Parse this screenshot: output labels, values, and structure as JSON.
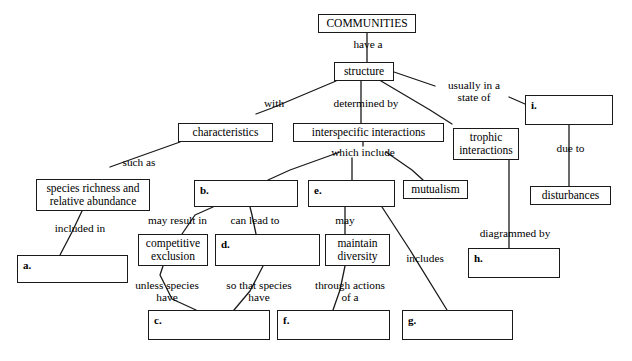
{
  "diagram": {
    "background_color": "#ffffff",
    "stroke_color": "#1a1a1a",
    "nodes": [
      {
        "id": "communities",
        "label": "COMMUNITIES",
        "x": 318,
        "y": 14,
        "w": 98,
        "h": 19,
        "blank": false
      },
      {
        "id": "structure",
        "label": "structure",
        "x": 334,
        "y": 62,
        "w": 60,
        "h": 19,
        "blank": false
      },
      {
        "id": "characteristics",
        "label": "characteristics",
        "x": 178,
        "y": 123,
        "w": 95,
        "h": 19,
        "blank": false
      },
      {
        "id": "interspecific",
        "label": "interspecific interactions",
        "x": 293,
        "y": 123,
        "w": 151,
        "h": 19,
        "blank": false
      },
      {
        "id": "trophic",
        "label": "trophic\ninteractions",
        "x": 453,
        "y": 128,
        "w": 66,
        "h": 32,
        "blank": false
      },
      {
        "id": "box_i",
        "label": "i.",
        "x": 525,
        "y": 95,
        "w": 88,
        "h": 30,
        "blank": true
      },
      {
        "id": "disturbances",
        "label": "disturbances",
        "x": 530,
        "y": 186,
        "w": 81,
        "h": 19,
        "blank": false
      },
      {
        "id": "species_richness",
        "label": "species richness and\nrelative abundance",
        "x": 36,
        "y": 179,
        "w": 114,
        "h": 32,
        "blank": false
      },
      {
        "id": "box_b",
        "label": "b.",
        "x": 194,
        "y": 180,
        "w": 104,
        "h": 27,
        "blank": true
      },
      {
        "id": "box_e",
        "label": "e.",
        "x": 308,
        "y": 180,
        "w": 87,
        "h": 27,
        "blank": true
      },
      {
        "id": "mutualism",
        "label": "mutualism",
        "x": 403,
        "y": 180,
        "w": 65,
        "h": 19,
        "blank": false
      },
      {
        "id": "box_a",
        "label": "a.",
        "x": 17,
        "y": 255,
        "w": 111,
        "h": 28,
        "blank": true
      },
      {
        "id": "competitive",
        "label": "competitive\nexclusion",
        "x": 138,
        "y": 234,
        "w": 70,
        "h": 32,
        "blank": false
      },
      {
        "id": "box_d",
        "label": "d.",
        "x": 215,
        "y": 234,
        "w": 105,
        "h": 32,
        "blank": true
      },
      {
        "id": "maintain",
        "label": "maintain\ndiversity",
        "x": 325,
        "y": 234,
        "w": 65,
        "h": 32,
        "blank": false
      },
      {
        "id": "box_h",
        "label": "h.",
        "x": 468,
        "y": 248,
        "w": 92,
        "h": 30,
        "blank": true
      },
      {
        "id": "box_c",
        "label": "c.",
        "x": 148,
        "y": 310,
        "w": 122,
        "h": 30,
        "blank": true
      },
      {
        "id": "box_f",
        "label": "f.",
        "x": 277,
        "y": 310,
        "w": 113,
        "h": 30,
        "blank": true
      },
      {
        "id": "box_g",
        "label": "g.",
        "x": 402,
        "y": 310,
        "w": 111,
        "h": 30,
        "blank": true
      }
    ],
    "link_labels": [
      {
        "id": "have_a",
        "text": "have a",
        "x": 342,
        "y": 38,
        "w": 52
      },
      {
        "id": "with",
        "text": "with",
        "x": 256,
        "y": 97,
        "w": 36
      },
      {
        "id": "determined_by",
        "text": "determined by",
        "x": 325,
        "y": 97,
        "w": 82
      },
      {
        "id": "usually_in_a",
        "text": "usually in a\nstate of",
        "x": 438,
        "y": 79,
        "w": 72
      },
      {
        "id": "such_as",
        "text": "such as",
        "x": 116,
        "y": 156,
        "w": 46
      },
      {
        "id": "which_include",
        "text": "which include",
        "x": 322,
        "y": 146,
        "w": 82
      },
      {
        "id": "due_to",
        "text": "due to",
        "x": 548,
        "y": 142,
        "w": 45
      },
      {
        "id": "included_in",
        "text": "included in",
        "x": 47,
        "y": 222,
        "w": 66
      },
      {
        "id": "may_result_in",
        "text": "may result in",
        "x": 139,
        "y": 214,
        "w": 77
      },
      {
        "id": "can_lead_to",
        "text": "can lead to",
        "x": 222,
        "y": 214,
        "w": 66
      },
      {
        "id": "may",
        "text": "may",
        "x": 330,
        "y": 214,
        "w": 30
      },
      {
        "id": "includes",
        "text": "includes",
        "x": 399,
        "y": 252,
        "w": 52
      },
      {
        "id": "diagrammed_by",
        "text": "diagrammed by",
        "x": 470,
        "y": 227,
        "w": 90
      },
      {
        "id": "unless_species_have",
        "text": "unless species\nhave",
        "x": 125,
        "y": 279,
        "w": 84
      },
      {
        "id": "so_that_species_have",
        "text": "so that species\nhave",
        "x": 215,
        "y": 279,
        "w": 88
      },
      {
        "id": "through_actions_of_a",
        "text": "through actions\nof a",
        "x": 304,
        "y": 279,
        "w": 92
      }
    ],
    "edges": [
      {
        "id": "communities-structure",
        "from": "communities",
        "to": "structure",
        "points": [
          [
            367,
            33
          ],
          [
            367,
            38
          ],
          [
            367,
            52
          ],
          [
            367,
            62
          ]
        ]
      },
      {
        "id": "structure-characteristics",
        "from": "structure",
        "to": "characteristics",
        "points": [
          [
            336,
            81
          ],
          [
            272,
            108
          ],
          [
            256,
            114
          ]
        ]
      },
      {
        "id": "structure-interspecific",
        "from": "structure",
        "to": "interspecific",
        "points": [
          [
            361,
            81
          ],
          [
            361,
            97
          ],
          [
            361,
            123
          ]
        ]
      },
      {
        "id": "structure-trophic",
        "from": "structure",
        "to": "trophic",
        "points": [
          [
            381,
            81
          ],
          [
            430,
            110
          ],
          [
            452,
            124
          ]
        ]
      },
      {
        "id": "structure-usually",
        "from": "structure",
        "to": "usually_in_a",
        "points": [
          [
            394,
            72
          ],
          [
            435,
            86
          ]
        ]
      },
      {
        "id": "usually-box_i",
        "from": "usually_in_a",
        "to": "box_i",
        "points": [
          [
            509,
            97
          ],
          [
            525,
            104
          ]
        ]
      },
      {
        "id": "box_i-disturbances",
        "from": "box_i",
        "to": "disturbances",
        "points": [
          [
            569,
            125
          ],
          [
            569,
            142
          ],
          [
            569,
            186
          ]
        ]
      },
      {
        "id": "characteristics-species",
        "from": "characteristics",
        "to": "species_richness",
        "points": [
          [
            180,
            142
          ],
          [
            135,
            158
          ],
          [
            110,
            167
          ]
        ]
      },
      {
        "id": "species-box_a",
        "from": "species_richness",
        "to": "box_a",
        "points": [
          [
            82,
            211
          ],
          [
            72,
            232
          ],
          [
            60,
            255
          ]
        ]
      },
      {
        "id": "interspecific-whichinclude",
        "from": "interspecific",
        "to": "which_include",
        "points": [
          [
            363,
            141
          ],
          [
            363,
            146
          ]
        ]
      },
      {
        "id": "whichinclude-box_b",
        "from": "which_include",
        "to": "box_b",
        "points": [
          [
            340,
            152
          ],
          [
            290,
            170
          ],
          [
            268,
            180
          ]
        ]
      },
      {
        "id": "whichinclude-box_e",
        "from": "which_include",
        "to": "box_e",
        "points": [
          [
            352,
            158
          ],
          [
            352,
            180
          ]
        ]
      },
      {
        "id": "whichinclude-mutualism",
        "from": "which_include",
        "to": "mutualism",
        "points": [
          [
            386,
            152
          ],
          [
            412,
            170
          ],
          [
            423,
            180
          ]
        ]
      },
      {
        "id": "box_b-competitive",
        "from": "box_b",
        "to": "competitive",
        "points": [
          [
            213,
            207
          ],
          [
            195,
            215
          ],
          [
            182,
            234
          ]
        ]
      },
      {
        "id": "box_b-box_d",
        "from": "box_b",
        "to": "box_d",
        "points": [
          [
            250,
            207
          ],
          [
            252,
            215
          ],
          [
            256,
            234
          ]
        ]
      },
      {
        "id": "box_e-maintain",
        "from": "box_e",
        "to": "maintain",
        "points": [
          [
            345,
            207
          ],
          [
            345,
            215
          ],
          [
            345,
            234
          ]
        ]
      },
      {
        "id": "box_e-box_g",
        "from": "box_e",
        "to": "box_g",
        "points": [
          [
            382,
            207
          ],
          [
            410,
            250
          ],
          [
            447,
            310
          ]
        ]
      },
      {
        "id": "trophic-box_h",
        "from": "trophic",
        "to": "box_h",
        "points": [
          [
            509,
            160
          ],
          [
            509,
            227
          ],
          [
            509,
            248
          ]
        ]
      },
      {
        "id": "competitive-box_c",
        "from": "competitive",
        "to": "box_c",
        "points": [
          [
            163,
            266
          ],
          [
            160,
            275
          ],
          [
            172,
            299
          ],
          [
            196,
            310
          ]
        ]
      },
      {
        "id": "box_d-box_c",
        "from": "box_d",
        "to": "box_c",
        "points": [
          [
            263,
            266
          ],
          [
            250,
            291
          ],
          [
            234,
            310
          ]
        ]
      },
      {
        "id": "maintain-box_f",
        "from": "maintain",
        "to": "box_f",
        "points": [
          [
            345,
            266
          ],
          [
            340,
            290
          ],
          [
            333,
            310
          ]
        ]
      }
    ]
  }
}
